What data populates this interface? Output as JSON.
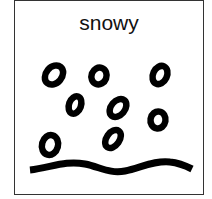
{
  "card": {
    "label": "snowy",
    "icon": "snow-weather-icon",
    "ink_color": "#000000",
    "border_color": "#333333"
  }
}
